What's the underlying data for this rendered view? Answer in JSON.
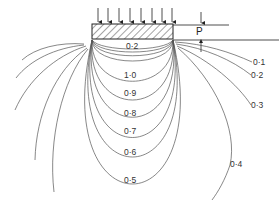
{
  "diagram": {
    "load_label": "P",
    "footing": {
      "x": 92,
      "y": 24,
      "width": 81,
      "height": 15
    },
    "load_arrows_x": [
      98,
      108,
      118,
      128,
      138,
      148,
      158,
      168
    ],
    "inner_contours": [
      {
        "label": "0·2",
        "depth": 50,
        "label_x": 133,
        "label_y": 49
      },
      {
        "label": "1·0",
        "depth": 84,
        "label_x": 131,
        "label_y": 78
      },
      {
        "label": "0·9",
        "depth": 102,
        "label_x": 131,
        "label_y": 96
      },
      {
        "label": "0·8",
        "depth": 120,
        "label_x": 131,
        "label_y": 116
      },
      {
        "label": "0·7",
        "depth": 141,
        "label_x": 131,
        "label_y": 134
      },
      {
        "label": "0·6",
        "depth": 163,
        "label_x": 131,
        "label_y": 155
      },
      {
        "label": "0·5",
        "depth": 191,
        "label_x": 131,
        "label_y": 183
      }
    ],
    "outer_contours": [
      {
        "label": "0·1",
        "label_x": 253,
        "label_y": 65
      },
      {
        "label": "0·2",
        "label_x": 251,
        "label_y": 78
      },
      {
        "label": "0·3",
        "label_x": 251,
        "label_y": 108
      },
      {
        "label": "0·4",
        "label_x": 230,
        "label_y": 167
      }
    ]
  }
}
